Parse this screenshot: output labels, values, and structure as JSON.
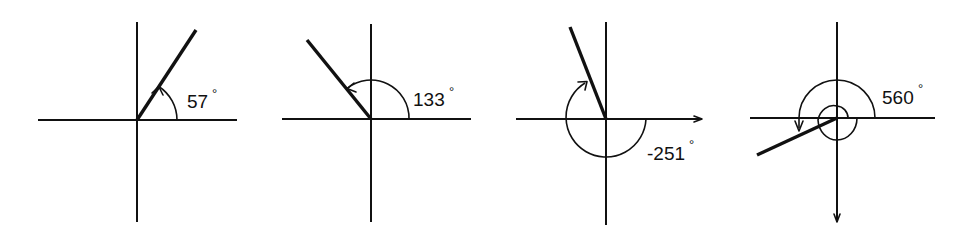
{
  "figure": {
    "title": "",
    "panels": [
      {
        "id": "angle-57",
        "label": "57",
        "degree_symbol": "°",
        "angle_deg": 57,
        "direction": "counterclockwise"
      },
      {
        "id": "angle-133",
        "label": "133",
        "degree_symbol": "°",
        "angle_deg": 133,
        "direction": "counterclockwise"
      },
      {
        "id": "angle-neg251",
        "label": "-251",
        "degree_symbol": "°",
        "angle_deg": -251,
        "direction": "clockwise"
      },
      {
        "id": "angle-560",
        "label": "560",
        "degree_symbol": "°",
        "angle_deg": 560,
        "direction": "counterclockwise"
      }
    ]
  },
  "colors": {
    "ink": "#111111",
    "background": "#ffffff"
  }
}
